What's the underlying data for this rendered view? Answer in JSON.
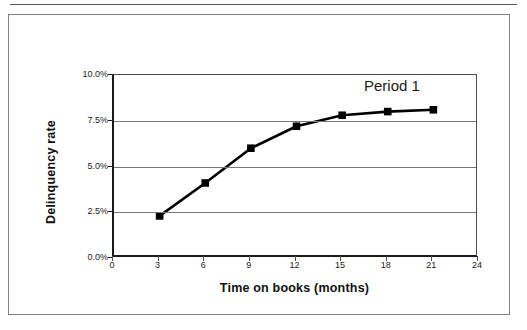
{
  "figure": {
    "annotation": "Period 1"
  },
  "chart_data": {
    "type": "line",
    "title": "",
    "xlabel": "Time on books (months)",
    "ylabel": "Delinquency rate",
    "x": [
      3,
      6,
      9,
      12,
      15,
      18,
      21
    ],
    "values": [
      2.3,
      4.1,
      6.0,
      7.2,
      7.8,
      8.0,
      8.1
    ],
    "series": [
      {
        "name": "Period 1",
        "x": [
          3,
          6,
          9,
          12,
          15,
          18,
          21
        ],
        "values": [
          2.3,
          4.1,
          6.0,
          7.2,
          7.8,
          8.0,
          8.1
        ]
      }
    ],
    "xlim": [
      0,
      24
    ],
    "ylim": [
      0,
      10
    ],
    "xticks": [
      0,
      3,
      6,
      9,
      12,
      15,
      18,
      21,
      24
    ],
    "xtick_labels": [
      "0",
      "3",
      "6",
      "9",
      "12",
      "15",
      "18",
      "21",
      "24"
    ],
    "yticks": [
      0,
      2.5,
      5,
      7.5,
      10
    ],
    "ytick_labels": [
      "0.0%",
      "2.5%",
      "5.0%",
      "7.5%",
      "10.0%"
    ],
    "grid": "horizontal",
    "legend": "none",
    "annotations": [
      "Period 1"
    ],
    "marker": "square",
    "line_color": "#000000",
    "marker_color": "#000000"
  }
}
